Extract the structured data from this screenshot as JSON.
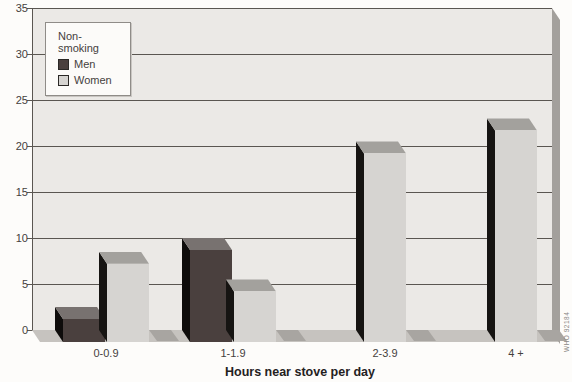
{
  "chart_data": {
    "type": "bar",
    "style": "3d-extruded-bars",
    "title": "",
    "xlabel": "Hours near stove per day",
    "ylabel": "",
    "categories": [
      "0-0.9",
      "1-1.9",
      "2-3.9",
      "4 +"
    ],
    "series": [
      {
        "name": "Men",
        "values": [
          2.5,
          10,
          null,
          null
        ],
        "front_color": "#4a403e",
        "top_color": "#787270",
        "side_color": "#0e0c0b"
      },
      {
        "name": "Women",
        "values": [
          8.5,
          5.5,
          20.5,
          23
        ],
        "front_color": "#d6d4d1",
        "top_color": "#a3a19d",
        "side_color": "#161412"
      }
    ],
    "legend": {
      "title": "Non-smoking",
      "position": "top-left"
    },
    "ylim": [
      0,
      35
    ],
    "yticks": [
      0,
      5,
      10,
      15,
      20,
      25,
      30,
      35
    ],
    "grid": "horizontal",
    "legend_entries": [
      "Men",
      "Women"
    ]
  },
  "colors": {
    "page_background": "#fdfcfa",
    "plot_background": "#ebe9e6",
    "gridline": "#5a5651",
    "floor": "#c6c3bf",
    "right_wall": "#a3a09c",
    "bar_floor_shadow": "#a8a5a1",
    "axis_text": "#45413d",
    "title_text": "#24211e"
  },
  "credit": "WHO 92184"
}
